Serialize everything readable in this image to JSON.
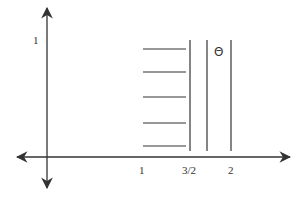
{
  "diagram": {
    "type": "coordinate-plane-sketch",
    "colors": {
      "stroke": "#333333",
      "background": "#ffffff"
    },
    "axes": {
      "x_axis": {
        "y": 157,
        "x_start": 17,
        "x_end": 290,
        "arrows": [
          "left",
          "right"
        ]
      },
      "y_axis": {
        "x": 47,
        "y_start": 8,
        "y_end": 188,
        "arrows": [
          "up",
          "down"
        ]
      }
    },
    "labels": {
      "y_tick_1": "1",
      "x_tick_1": "1",
      "x_tick_3_2": "3/2",
      "x_tick_2": "2",
      "region": "Θ"
    },
    "horizontal_segments": {
      "x_start": 143,
      "x_end": 186,
      "y_values": [
        49,
        72,
        97,
        123,
        146
      ]
    },
    "vertical_lines": {
      "y_top": 40,
      "y_bottom": 151,
      "x_values": [
        190,
        207,
        231
      ]
    }
  }
}
